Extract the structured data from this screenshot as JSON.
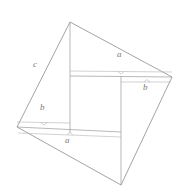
{
  "figure": {
    "type": "geometric-diagram",
    "canvas": {
      "width": 189,
      "height": 194,
      "background": "#ffffff"
    },
    "stroke": {
      "outer_color": "#8c8c8c",
      "inner_color": "#a0a0a0",
      "brace_color": "#b4b4b4",
      "outer_width": 0.8,
      "inner_width": 0.7,
      "brace_width": 0.6
    },
    "outer_square": {
      "name": "outer-tilted-square",
      "vertices": [
        {
          "id": "top",
          "x": 70,
          "y": 22
        },
        {
          "id": "right",
          "x": 172,
          "y": 77
        },
        {
          "id": "bottom",
          "x": 121,
          "y": 185
        },
        {
          "id": "left",
          "x": 17,
          "y": 127
        }
      ]
    },
    "inner_square": {
      "name": "inner-square",
      "vertices": [
        {
          "id": "inner-top-left",
          "x": 70,
          "y": 76
        },
        {
          "id": "inner-top-right",
          "x": 172,
          "y": 77
        },
        {
          "id": "inner-bottom-right",
          "x": 121,
          "y": 132
        },
        {
          "id": "inner-bottom-left",
          "x": 17,
          "y": 127
        }
      ]
    },
    "segments": [
      {
        "id": "seg-top-left-edge",
        "x1": 70,
        "y1": 22,
        "x2": 17,
        "y2": 127
      },
      {
        "id": "seg-top-right-edge",
        "x1": 70,
        "y1": 22,
        "x2": 172,
        "y2": 77
      },
      {
        "id": "seg-right-bottom-edge",
        "x1": 172,
        "y1": 77,
        "x2": 121,
        "y2": 185
      },
      {
        "id": "seg-left-bottom-edge",
        "x1": 17,
        "y1": 127,
        "x2": 121,
        "y2": 185
      },
      {
        "id": "seg-inner-top",
        "x1": 70,
        "y1": 76,
        "x2": 172,
        "y2": 77
      },
      {
        "id": "seg-inner-bottom",
        "x1": 17,
        "y1": 127,
        "x2": 121,
        "y2": 132
      },
      {
        "id": "seg-vertical-left",
        "x1": 70,
        "y1": 22,
        "x2": 70,
        "y2": 132
      },
      {
        "id": "seg-vertical-right",
        "x1": 121,
        "y1": 76,
        "x2": 121,
        "y2": 185
      }
    ],
    "braces": [
      {
        "id": "brace-a-top",
        "label": "a",
        "x1": 70,
        "y1": 71,
        "x2": 172,
        "y2": 72,
        "tick_x": 121,
        "tick_y": 71,
        "tick_dir": "down",
        "label_x": 117,
        "label_y": 55
      },
      {
        "id": "brace-b-right",
        "label": "b",
        "x1": 121,
        "y1": 82,
        "x2": 172,
        "y2": 82,
        "tick_x": 147,
        "tick_y": 82,
        "tick_dir": "down",
        "label_x": 143,
        "label_y": 85
      },
      {
        "id": "brace-b-left",
        "label": "b",
        "x1": 17,
        "y1": 122,
        "x2": 70,
        "y2": 123,
        "tick_x": 44,
        "tick_y": 123,
        "tick_dir": "down",
        "label_x": 40,
        "label_y": 108
      },
      {
        "id": "brace-a-bottom",
        "label": "a",
        "x1": 17,
        "y1": 133,
        "x2": 121,
        "y2": 137,
        "tick_x": 70,
        "tick_y": 135,
        "tick_dir": "down",
        "label_x": 65,
        "label_y": 137
      }
    ],
    "labels": [
      {
        "id": "label-c",
        "text": "c",
        "x": 33,
        "y": 65,
        "name": "side-label-c"
      },
      {
        "id": "label-a-top",
        "text": "a",
        "x": 117,
        "y": 54,
        "name": "side-label-a-top"
      },
      {
        "id": "label-b-right",
        "text": "b",
        "x": 143,
        "y": 84,
        "name": "side-label-b-right"
      },
      {
        "id": "label-b-left",
        "text": "b",
        "x": 40,
        "y": 107,
        "name": "side-label-b-left"
      },
      {
        "id": "label-a-bottom",
        "text": "a",
        "x": 65,
        "y": 136,
        "name": "side-label-a-bottom"
      }
    ]
  }
}
